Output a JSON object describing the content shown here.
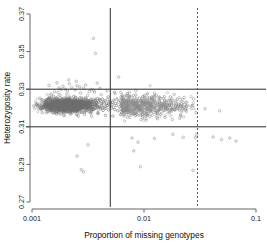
{
  "chart_data": {
    "type": "scatter",
    "title": "",
    "xlabel": "Proportion of missing genotypes",
    "ylabel": "Heterozygosity rate",
    "x_scale": "log",
    "y_scale": "linear",
    "xlim": [
      0.001,
      0.1
    ],
    "ylim": [
      0.27,
      0.37
    ],
    "x_ticks": [
      0.001,
      0.01,
      0.1
    ],
    "x_tick_labels": [
      "0.001",
      "0.01",
      "0.1"
    ],
    "y_ticks": [
      0.27,
      0.29,
      0.31,
      0.33,
      0.35,
      0.37
    ],
    "y_tick_labels": [
      "0.27",
      "0.29",
      "0.31",
      "0.33",
      "0.35",
      "0.37"
    ],
    "grid": false,
    "legend": "none",
    "point_color": "#8a8a8a",
    "point_marker": "open-circle",
    "threshold_lines": [
      {
        "name": "het-upper-threshold",
        "orientation": "horizontal",
        "value": 0.33,
        "style": "solid",
        "color": "#2b2b2b"
      },
      {
        "name": "het-lower-threshold",
        "orientation": "horizontal",
        "value": 0.31,
        "style": "solid",
        "color": "#2b2b2b"
      },
      {
        "name": "missingness-threshold-solid",
        "orientation": "vertical",
        "value": 0.005,
        "style": "solid",
        "color": "#555555"
      },
      {
        "name": "missingness-threshold-dashed",
        "orientation": "vertical",
        "value": 0.03,
        "style": "dashed",
        "color": "#555555"
      }
    ],
    "points": [
      [
        0.0013,
        0.3208
      ],
      [
        0.00132,
        0.3229
      ],
      [
        0.00134,
        0.3195
      ],
      [
        0.00136,
        0.3241
      ],
      [
        0.00138,
        0.318
      ],
      [
        0.0014,
        0.3218
      ],
      [
        0.00141,
        0.325
      ],
      [
        0.00143,
        0.3199
      ],
      [
        0.00145,
        0.3228
      ],
      [
        0.00147,
        0.3186
      ],
      [
        0.00148,
        0.3234
      ],
      [
        0.0015,
        0.3211
      ],
      [
        0.00152,
        0.3246
      ],
      [
        0.00154,
        0.3175
      ],
      [
        0.00155,
        0.3222
      ],
      [
        0.00157,
        0.3203
      ],
      [
        0.00159,
        0.3239
      ],
      [
        0.00161,
        0.319
      ],
      [
        0.00163,
        0.3225
      ],
      [
        0.00165,
        0.3214
      ],
      [
        0.00166,
        0.3252
      ],
      [
        0.00168,
        0.3181
      ],
      [
        0.0017,
        0.323
      ],
      [
        0.00172,
        0.3206
      ],
      [
        0.00174,
        0.3243
      ],
      [
        0.00176,
        0.3192
      ],
      [
        0.00178,
        0.322
      ],
      [
        0.0018,
        0.3236
      ],
      [
        0.00181,
        0.3198
      ],
      [
        0.00183,
        0.3226
      ],
      [
        0.00185,
        0.321
      ],
      [
        0.00187,
        0.3248
      ],
      [
        0.00189,
        0.3177
      ],
      [
        0.00191,
        0.3232
      ],
      [
        0.00193,
        0.3205
      ],
      [
        0.00195,
        0.324
      ],
      [
        0.00197,
        0.3188
      ],
      [
        0.00199,
        0.3223
      ],
      [
        0.00201,
        0.3215
      ],
      [
        0.00203,
        0.3254
      ],
      [
        0.00205,
        0.3183
      ],
      [
        0.00207,
        0.3231
      ],
      [
        0.00209,
        0.3202
      ],
      [
        0.00211,
        0.3245
      ],
      [
        0.00213,
        0.3194
      ],
      [
        0.00215,
        0.3221
      ],
      [
        0.00218,
        0.3237
      ],
      [
        0.0022,
        0.32
      ],
      [
        0.00222,
        0.3227
      ],
      [
        0.00224,
        0.3212
      ],
      [
        0.00226,
        0.3249
      ],
      [
        0.00229,
        0.3179
      ],
      [
        0.00231,
        0.3233
      ],
      [
        0.00233,
        0.3207
      ],
      [
        0.00236,
        0.3242
      ],
      [
        0.00238,
        0.3189
      ],
      [
        0.0024,
        0.3224
      ],
      [
        0.00243,
        0.3217
      ],
      [
        0.00245,
        0.3256
      ],
      [
        0.00248,
        0.3184
      ],
      [
        0.0025,
        0.3235
      ],
      [
        0.00253,
        0.3204
      ],
      [
        0.00255,
        0.3247
      ],
      [
        0.00258,
        0.3196
      ],
      [
        0.00261,
        0.3219
      ],
      [
        0.00263,
        0.3238
      ],
      [
        0.00266,
        0.3201
      ],
      [
        0.00269,
        0.3229
      ],
      [
        0.00272,
        0.3213
      ],
      [
        0.00275,
        0.3251
      ],
      [
        0.00278,
        0.3178
      ],
      [
        0.00281,
        0.3234
      ],
      [
        0.00284,
        0.3209
      ],
      [
        0.00287,
        0.3244
      ],
      [
        0.0029,
        0.3191
      ],
      [
        0.00293,
        0.3222
      ],
      [
        0.00296,
        0.3216
      ],
      [
        0.003,
        0.3253
      ],
      [
        0.00303,
        0.3186
      ],
      [
        0.00306,
        0.323
      ],
      [
        0.0031,
        0.3203
      ],
      [
        0.00313,
        0.324
      ],
      [
        0.00317,
        0.3197
      ],
      [
        0.00321,
        0.3225
      ],
      [
        0.00324,
        0.3236
      ],
      [
        0.00328,
        0.3206
      ],
      [
        0.00332,
        0.3218
      ],
      [
        0.00336,
        0.3247
      ],
      [
        0.0034,
        0.3182
      ],
      [
        0.00344,
        0.3231
      ],
      [
        0.00348,
        0.3208
      ],
      [
        0.00352,
        0.3243
      ],
      [
        0.00357,
        0.3193
      ],
      [
        0.00361,
        0.322
      ],
      [
        0.00365,
        0.3239
      ],
      [
        0.0037,
        0.32
      ],
      [
        0.00375,
        0.3228
      ],
      [
        0.00379,
        0.3211
      ],
      [
        0.00384,
        0.325
      ],
      [
        0.00389,
        0.3176
      ],
      [
        0.00394,
        0.3233
      ],
      [
        0.00399,
        0.3205
      ],
      [
        0.00404,
        0.3241
      ],
      [
        0.00409,
        0.3195
      ],
      [
        0.00415,
        0.3223
      ],
      [
        0.0042,
        0.3215
      ],
      [
        0.00426,
        0.3246
      ],
      [
        0.00431,
        0.3187
      ],
      [
        0.00437,
        0.3232
      ],
      [
        0.00443,
        0.3202
      ],
      [
        0.00449,
        0.3238
      ],
      [
        0.00455,
        0.3198
      ],
      [
        0.00461,
        0.3221
      ],
      [
        0.00468,
        0.3213
      ],
      [
        0.00474,
        0.3244
      ],
      [
        0.00481,
        0.319
      ],
      [
        0.00488,
        0.3227
      ],
      [
        0.00495,
        0.3209
      ],
      [
        0.00502,
        0.3235
      ],
      [
        0.00509,
        0.3199
      ],
      [
        0.00517,
        0.3219
      ],
      [
        0.00524,
        0.323
      ],
      [
        0.00532,
        0.3204
      ],
      [
        0.0054,
        0.3242
      ],
      [
        0.00548,
        0.3192
      ],
      [
        0.00557,
        0.3224
      ],
      [
        0.00565,
        0.3214
      ],
      [
        0.00574,
        0.3248
      ],
      [
        0.00583,
        0.3185
      ],
      [
        0.00592,
        0.3231
      ],
      [
        0.00601,
        0.3207
      ],
      [
        0.00611,
        0.324
      ],
      [
        0.00621,
        0.3196
      ],
      [
        0.00631,
        0.3222
      ],
      [
        0.00641,
        0.3217
      ],
      [
        0.00652,
        0.3245
      ],
      [
        0.00663,
        0.3188
      ],
      [
        0.00674,
        0.3229
      ],
      [
        0.00685,
        0.3203
      ],
      [
        0.00697,
        0.3237
      ],
      [
        0.00709,
        0.3194
      ],
      [
        0.00721,
        0.322
      ],
      [
        0.00734,
        0.3212
      ],
      [
        0.00747,
        0.3243
      ],
      [
        0.0076,
        0.3183
      ],
      [
        0.00774,
        0.3226
      ],
      [
        0.00788,
        0.3206
      ],
      [
        0.00802,
        0.3234
      ],
      [
        0.00817,
        0.3197
      ],
      [
        0.00832,
        0.3216
      ],
      [
        0.00847,
        0.3228
      ],
      [
        0.00863,
        0.3201
      ],
      [
        0.00879,
        0.3239
      ],
      [
        0.00896,
        0.3191
      ],
      [
        0.00913,
        0.3221
      ],
      [
        0.0093,
        0.321
      ],
      [
        0.00948,
        0.3241
      ],
      [
        0.00966,
        0.318
      ],
      [
        0.00985,
        0.3225
      ],
      [
        0.01004,
        0.3205
      ],
      [
        0.01023,
        0.3233
      ],
      [
        0.01043,
        0.3193
      ],
      [
        0.01064,
        0.3218
      ],
      [
        0.01085,
        0.3209
      ],
      [
        0.01106,
        0.3236
      ],
      [
        0.01128,
        0.3189
      ],
      [
        0.01151,
        0.3223
      ],
      [
        0.01174,
        0.3202
      ],
      [
        0.01197,
        0.323
      ],
      [
        0.01221,
        0.3196
      ],
      [
        0.01246,
        0.3214
      ],
      [
        0.01271,
        0.3227
      ],
      [
        0.01297,
        0.3186
      ],
      [
        0.01323,
        0.3219
      ],
      [
        0.0135,
        0.3208
      ],
      [
        0.01378,
        0.3232
      ],
      [
        0.01406,
        0.3199
      ],
      [
        0.01435,
        0.3213
      ],
      [
        0.01464,
        0.3224
      ],
      [
        0.01494,
        0.319
      ],
      [
        0.01525,
        0.3217
      ],
      [
        0.01556,
        0.3206
      ],
      [
        0.01588,
        0.3228
      ],
      [
        0.01621,
        0.3195
      ],
      [
        0.01654,
        0.3211
      ],
      [
        0.01688,
        0.3221
      ],
      [
        0.01723,
        0.3187
      ],
      [
        0.01759,
        0.3215
      ],
      [
        0.01795,
        0.3204
      ],
      [
        0.01832,
        0.3226
      ],
      [
        0.0187,
        0.3192
      ],
      [
        0.01909,
        0.3212
      ],
      [
        0.01949,
        0.322
      ],
      [
        0.01989,
        0.32
      ],
      [
        0.02031,
        0.3216
      ],
      [
        0.02073,
        0.3189
      ],
      [
        0.02116,
        0.321
      ],
      [
        0.0216,
        0.3223
      ],
      [
        0.02205,
        0.3198
      ],
      [
        0.02251,
        0.3207
      ],
      [
        0.02298,
        0.3218
      ],
      [
        0.02346,
        0.3194
      ],
      [
        0.02395,
        0.3209
      ],
      [
        0.02445,
        0.3214
      ],
      [
        0.00165,
        0.3168
      ],
      [
        0.00192,
        0.316
      ],
      [
        0.00221,
        0.3173
      ],
      [
        0.00258,
        0.3158
      ],
      [
        0.00295,
        0.3166
      ],
      [
        0.00341,
        0.3155
      ],
      [
        0.00388,
        0.317
      ],
      [
        0.00452,
        0.3161
      ],
      [
        0.00527,
        0.3157
      ],
      [
        0.00614,
        0.3164
      ],
      [
        0.00716,
        0.3151
      ],
      [
        0.00834,
        0.3159
      ],
      [
        0.00972,
        0.3147
      ],
      [
        0.01133,
        0.3154
      ],
      [
        0.0132,
        0.3143
      ],
      [
        0.01538,
        0.315
      ],
      [
        0.01792,
        0.3139
      ],
      [
        0.02088,
        0.3146
      ],
      [
        0.00178,
        0.3268
      ],
      [
        0.00205,
        0.3275
      ],
      [
        0.00236,
        0.3262
      ],
      [
        0.00272,
        0.328
      ],
      [
        0.00313,
        0.3266
      ],
      [
        0.00361,
        0.3285
      ],
      [
        0.00416,
        0.3271
      ],
      [
        0.00479,
        0.3259
      ],
      [
        0.00552,
        0.3277
      ],
      [
        0.00636,
        0.3264
      ],
      [
        0.00733,
        0.3258
      ],
      [
        0.00845,
        0.327
      ],
      [
        0.00974,
        0.3261
      ],
      [
        0.01122,
        0.3255
      ],
      [
        0.01293,
        0.3267
      ],
      [
        0.0149,
        0.3252
      ],
      [
        0.01717,
        0.3259
      ],
      [
        0.01979,
        0.3248
      ],
      [
        0.00243,
        0.3296
      ],
      [
        0.00289,
        0.3305
      ],
      [
        0.00208,
        0.3291
      ],
      [
        0.00324,
        0.3287
      ],
      [
        0.00171,
        0.3283
      ],
      [
        0.00198,
        0.33
      ],
      [
        0.00267,
        0.3312
      ],
      [
        0.00356,
        0.3294
      ],
      [
        0.00148,
        0.3274
      ],
      [
        0.00159,
        0.3286
      ],
      [
        0.00226,
        0.3309
      ],
      [
        0.00182,
        0.3298
      ],
      [
        0.00143,
        0.3254
      ],
      [
        0.00155,
        0.3263
      ],
      [
        0.00136,
        0.3243
      ],
      [
        0.00252,
        0.3318
      ],
      [
        0.00301,
        0.3322
      ],
      [
        0.00189,
        0.3315
      ],
      [
        0.00174,
        0.3307
      ],
      [
        0.00216,
        0.3329
      ],
      [
        0.00339,
        0.3298
      ],
      [
        0.00404,
        0.3305
      ],
      [
        0.00467,
        0.3292
      ],
      [
        0.00545,
        0.3285
      ],
      [
        0.00142,
        0.332
      ],
      [
        0.00167,
        0.3334
      ],
      [
        0.00213,
        0.335
      ],
      [
        0.00248,
        0.3342
      ],
      [
        0.00354,
        0.357
      ],
      [
        0.00368,
        0.349
      ],
      [
        0.00382,
        0.3332
      ],
      [
        0.00594,
        0.3364
      ],
      [
        0.0062,
        0.3283
      ],
      [
        0.00712,
        0.3275
      ],
      [
        0.00842,
        0.3292
      ],
      [
        0.01015,
        0.3268
      ],
      [
        0.0124,
        0.3279
      ],
      [
        0.0152,
        0.3261
      ],
      [
        0.0186,
        0.3272
      ],
      [
        0.0228,
        0.3256
      ],
      [
        0.0277,
        0.3249
      ],
      [
        0.00698,
        0.3266
      ],
      [
        0.0091,
        0.3253
      ],
      [
        0.0117,
        0.3259
      ],
      [
        0.00316,
        0.3004
      ],
      [
        0.00252,
        0.2944
      ],
      [
        0.00275,
        0.2872
      ],
      [
        0.00288,
        0.286
      ],
      [
        0.0078,
        0.304
      ],
      [
        0.00885,
        0.3018
      ],
      [
        0.0081,
        0.2972
      ],
      [
        0.0124,
        0.3038
      ],
      [
        0.00928,
        0.2888
      ],
      [
        0.0181,
        0.306
      ],
      [
        0.0224,
        0.3044
      ],
      [
        0.0287,
        0.3042
      ],
      [
        0.0293,
        0.3058
      ],
      [
        0.0274,
        0.2868
      ],
      [
        0.0415,
        0.3046
      ],
      [
        0.0492,
        0.3032
      ],
      [
        0.0583,
        0.304
      ],
      [
        0.0662,
        0.3024
      ],
      [
        0.0351,
        0.3196
      ],
      [
        0.0473,
        0.3185
      ],
      [
        0.0264,
        0.321
      ],
      [
        0.0291,
        0.3176
      ],
      [
        0.0235,
        0.3188
      ]
    ]
  }
}
